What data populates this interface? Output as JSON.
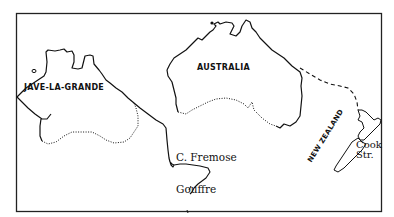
{
  "map": {
    "style": "hand-drawn outline map",
    "frame_color": "#222222",
    "ink_color": "#111111",
    "background": "#ffffff",
    "labels": {
      "jave_la_grande": "JAVE-LA-GRANDE",
      "australia": "AUSTRALIA",
      "fremose": "C. Fremose",
      "gouffre": "Gouffre",
      "new_zealand": "NEW ZEALAND",
      "cook_strait_line1": "Cook",
      "cook_strait_line2": "Str."
    },
    "features": [
      {
        "name": "Jave-la-Grande coastline",
        "line": "solid"
      },
      {
        "name": "Jave-la-Grande southern limit",
        "line": "dotted"
      },
      {
        "name": "Australia coastline",
        "line": "solid"
      },
      {
        "name": "Australia southern limit",
        "line": "dotted"
      },
      {
        "name": "Route to New Zealand",
        "line": "dashed"
      },
      {
        "name": "New Zealand islands",
        "line": "solid"
      }
    ]
  }
}
